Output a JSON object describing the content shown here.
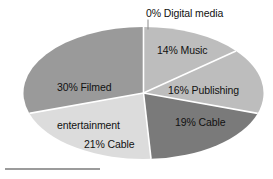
{
  "chart_data": {
    "type": "pie",
    "title": "",
    "subtitle": "",
    "xlabel": "",
    "ylabel": "",
    "legend_position": "none",
    "grid": false,
    "labels_inside": true,
    "categories": [
      "Digital media",
      "Music",
      "Publishing",
      "Cable",
      "Cable networks",
      "Filmed entertainment"
    ],
    "values": [
      0,
      14,
      16,
      19,
      21,
      30
    ],
    "unit": "%",
    "total": 100,
    "slices": [
      {
        "label": "0% Digital media",
        "name": "Digital media",
        "value": 0,
        "color": "#bdbdbd",
        "start_angle": 0,
        "end_angle": 0,
        "callout": true
      },
      {
        "label": "14% Music",
        "name": "Music",
        "value": 14,
        "color": "#bdbdbd",
        "start_angle": 0,
        "end_angle": 50.4,
        "callout": false
      },
      {
        "label": "16% Publishing",
        "name": "Publishing",
        "value": 16,
        "color": "#bdbdbd",
        "start_angle": 50.4,
        "end_angle": 108.0,
        "callout": false
      },
      {
        "label": "19% Cable",
        "name": "Cable",
        "value": 19,
        "color": "#7a7a7a",
        "start_angle": 108.0,
        "end_angle": 176.4,
        "callout": false
      },
      {
        "label": "21% Cable networks",
        "name": "Cable networks",
        "value": 21,
        "color": "#dcdcdc",
        "start_angle": 176.4,
        "end_angle": 252.0,
        "callout": false
      },
      {
        "label": "30% Filmed entertainment",
        "name": "Filmed entertainment",
        "value": 30,
        "color": "#9a9a9a",
        "start_angle": 252.0,
        "end_angle": 360.0,
        "callout": false
      }
    ]
  },
  "labels": {
    "digital_media": "0% Digital media",
    "music": "14% Music",
    "publishing": "16% Publishing",
    "cable": "19% Cable",
    "cable_networks_line1": "21% Cable",
    "cable_networks_line2": "networks",
    "filmed_line1": "30% Filmed",
    "filmed_line2": "entertainment"
  },
  "colors": {
    "background": "#ffffff",
    "text": "#111111",
    "slice_music": "#bdbdbd",
    "slice_publishing": "#bdbdbd",
    "slice_cable": "#7a7a7a",
    "slice_cable_networks": "#dcdcdc",
    "slice_filmed": "#9a9a9a",
    "divider": "#ffffff",
    "leader_line": "#8a8a8a",
    "bottom_rule": "#9b9b9b"
  }
}
